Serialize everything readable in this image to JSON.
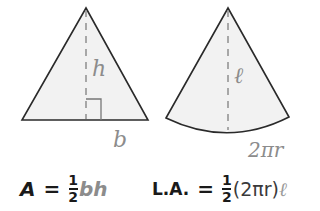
{
  "triangle": {
    "height_label": "h",
    "base_label": "b",
    "fill": "#f2f2f2",
    "stroke": "#2a2a2a",
    "label_color": "#8c8c8c"
  },
  "sector": {
    "slant_label": "ℓ",
    "arc_label": "2πr",
    "fill": "#f2f2f2",
    "stroke": "#2a2a2a",
    "label_color": "#8c8c8c"
  },
  "formula_area": {
    "lhs": "A",
    "eq": "=",
    "numerator": "1",
    "denominator": "2",
    "rhs": "bh"
  },
  "formula_lateral": {
    "lhs": "L.A.",
    "eq": "=",
    "numerator": "1",
    "denominator": "2",
    "rhs_dark": "(2πr)",
    "rhs_light": "ℓ"
  }
}
